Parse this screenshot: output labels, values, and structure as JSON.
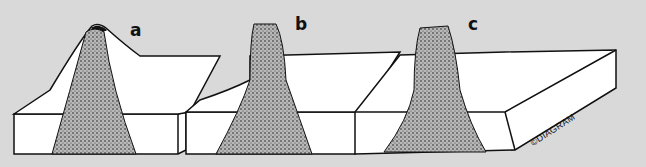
{
  "diagram": {
    "panels": [
      {
        "id": "a",
        "label": "a",
        "stage": "volcano cone with central vent plug"
      },
      {
        "id": "b",
        "label": "b",
        "stage": "cone partly eroded, plug exposed"
      },
      {
        "id": "c",
        "label": "c",
        "stage": "cone removed, volcanic neck stands above plain"
      }
    ],
    "copyright": "©DIAGRAM",
    "colors": {
      "background": "#d9d9d9",
      "block": "#ffffff",
      "outline": "#111111",
      "plug": "#8a8a8a"
    }
  }
}
